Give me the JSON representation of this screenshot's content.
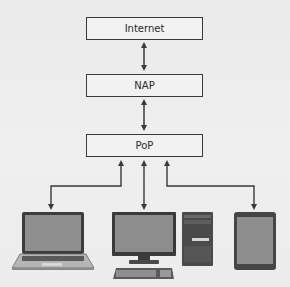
{
  "diagram": {
    "type": "network-hierarchy",
    "nodes": [
      {
        "id": "internet",
        "label": "Internet"
      },
      {
        "id": "nap",
        "label": "NAP"
      },
      {
        "id": "pop",
        "label": "PoP"
      }
    ],
    "devices": [
      {
        "id": "laptop",
        "label": "laptop"
      },
      {
        "id": "desktop",
        "label": "desktop computer"
      },
      {
        "id": "tablet",
        "label": "tablet"
      }
    ],
    "edges": [
      {
        "from": "internet",
        "to": "nap",
        "direction": "bidirectional"
      },
      {
        "from": "nap",
        "to": "pop",
        "direction": "bidirectional"
      },
      {
        "from": "pop",
        "to": "laptop",
        "direction": "bidirectional"
      },
      {
        "from": "pop",
        "to": "desktop",
        "direction": "bidirectional"
      },
      {
        "from": "pop",
        "to": "tablet",
        "direction": "bidirectional"
      }
    ],
    "colors": {
      "line": "#3a3a3a",
      "box_fill": "#f2f2f2",
      "screen": "#8a8a8a"
    }
  }
}
